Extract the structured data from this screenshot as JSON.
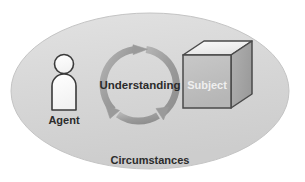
{
  "diagram": {
    "container": {
      "name": "Circumstances",
      "label": "Circumstances",
      "shape": "ellipse",
      "fill_color": "#d9d9d9",
      "stroke_color": "#c2c2c2",
      "label_color": "#2b2b2b",
      "cx": 150,
      "cy": 91,
      "rx": 139,
      "ry": 78,
      "label_x": 150,
      "label_y": 161
    },
    "nodes": [
      {
        "id": "agent",
        "icon": "person-icon",
        "label": "Agent",
        "label_x": 64,
        "label_y": 120,
        "label_color": "#2b2b2b",
        "fill_color": "#fbfbfb",
        "stroke_color": "#3a3a3a",
        "head_cx": 64,
        "head_cy": 64,
        "head_r": 9.5,
        "body_x": 52,
        "body_y": 74,
        "body_w": 24,
        "body_h": 36,
        "body_radius": 12
      },
      {
        "id": "understanding",
        "icon": "cycle-arrow-icon",
        "label": "Understanding",
        "label_x": 140,
        "label_y": 86,
        "label_color": "#2b2b2b",
        "ring_color": "#9a9a9a",
        "ring_highlight": "#b9b9b9",
        "cx": 140,
        "cy": 85,
        "r": 36,
        "stroke_width": 7,
        "arrow_count": 3
      },
      {
        "id": "subject",
        "icon": "cube-icon",
        "label": "Subject",
        "label_x": 207,
        "label_y": 86,
        "label_color": "#ececec",
        "front_fill": "#c0c0c0",
        "top_fill": "#f2f2f2",
        "side_fill": "#a8a8a8",
        "stroke_color": "#4a4a4a",
        "front_x": 183,
        "front_y": 55,
        "front_w": 48,
        "front_h": 53,
        "depth_x": 21,
        "depth_y": 14
      }
    ]
  }
}
